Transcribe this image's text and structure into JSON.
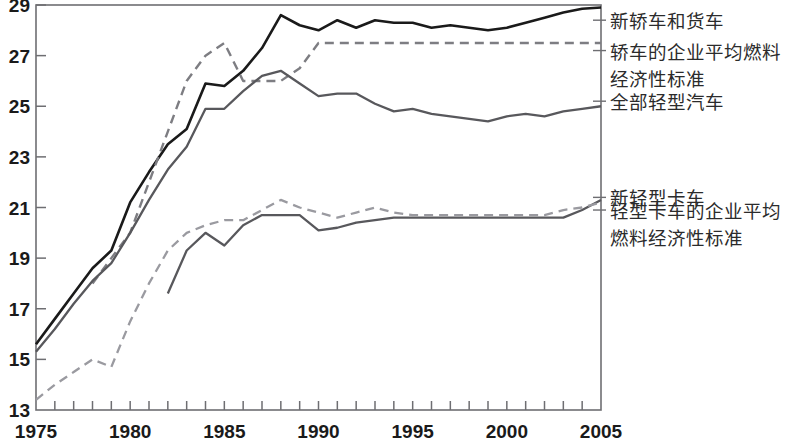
{
  "chart_data": {
    "type": "line",
    "title": "",
    "subtitle": "",
    "xlabel": "",
    "ylabel": "",
    "xlim": [
      1975,
      2005
    ],
    "ylim": [
      13,
      29
    ],
    "grid": false,
    "legend_position": "right-inline-annotations",
    "x_ticks": [
      1975,
      1980,
      1985,
      1990,
      1995,
      2000,
      2005
    ],
    "x_tick_labels": [
      "1975",
      "1980",
      "1985",
      "1990",
      "1995",
      "2000",
      "2005"
    ],
    "x_minor_tick_step": 1,
    "y_ticks": [
      13,
      15,
      17,
      19,
      21,
      23,
      25,
      27,
      29
    ],
    "y_tick_labels": [
      "13",
      "15",
      "17",
      "19",
      "21",
      "23",
      "25",
      "27",
      "29"
    ],
    "series": [
      {
        "name": "新轿车和货车",
        "style": "solid",
        "color": "#1a1a1a",
        "width": 2.6,
        "x": [
          1975,
          1976,
          1977,
          1978,
          1979,
          1980,
          1981,
          1982,
          1983,
          1984,
          1985,
          1986,
          1987,
          1988,
          1989,
          1990,
          1991,
          1992,
          1993,
          1994,
          1995,
          1996,
          1997,
          1998,
          1999,
          2000,
          2001,
          2002,
          2003,
          2004,
          2005
        ],
        "values": [
          15.6,
          16.6,
          17.6,
          18.6,
          19.3,
          21.2,
          22.4,
          23.5,
          24.1,
          25.9,
          25.8,
          26.4,
          27.3,
          28.6,
          28.2,
          28.0,
          28.4,
          28.1,
          28.4,
          28.3,
          28.3,
          28.1,
          28.2,
          28.1,
          28.0,
          28.1,
          28.3,
          28.5,
          28.7,
          28.85,
          28.9
        ]
      },
      {
        "name": "轿车的企业平均燃料经济性标准",
        "style": "dashed",
        "color": "#7d7d82",
        "width": 2.4,
        "x": [
          1978,
          1979,
          1980,
          1981,
          1982,
          1983,
          1984,
          1985,
          1986,
          1987,
          1988,
          1989,
          1990,
          1991,
          1992,
          1993,
          1994,
          1995,
          1996,
          1997,
          1998,
          1999,
          2000,
          2001,
          2002,
          2003,
          2004,
          2005
        ],
        "values": [
          18.0,
          19.0,
          20.0,
          22.0,
          24.0,
          26.0,
          27.0,
          27.5,
          26.0,
          26.0,
          26.0,
          26.5,
          27.5,
          27.5,
          27.5,
          27.5,
          27.5,
          27.5,
          27.5,
          27.5,
          27.5,
          27.5,
          27.5,
          27.5,
          27.5,
          27.5,
          27.5,
          27.5
        ]
      },
      {
        "name": "全部轻型汽车",
        "style": "solid",
        "color": "#58585c",
        "width": 2.3,
        "x": [
          1975,
          1976,
          1977,
          1978,
          1979,
          1980,
          1981,
          1982,
          1983,
          1984,
          1985,
          1986,
          1987,
          1988,
          1989,
          1990,
          1991,
          1992,
          1993,
          1994,
          1995,
          1996,
          1997,
          1998,
          1999,
          2000,
          2001,
          2002,
          2003,
          2004,
          2005
        ],
        "values": [
          15.3,
          16.2,
          17.2,
          18.1,
          18.8,
          20.0,
          21.3,
          22.5,
          23.4,
          24.9,
          24.9,
          25.6,
          26.2,
          26.4,
          25.9,
          25.4,
          25.5,
          25.5,
          25.1,
          24.8,
          24.9,
          24.7,
          24.6,
          24.5,
          24.4,
          24.6,
          24.7,
          24.6,
          24.8,
          24.9,
          25.0
        ]
      },
      {
        "name": "新轻型卡车",
        "style": "solid",
        "color": "#58585c",
        "width": 2.3,
        "x": [
          1982,
          1983,
          1984,
          1985,
          1986,
          1987,
          1988,
          1989,
          1990,
          1991,
          1992,
          1993,
          1994,
          1995,
          1996,
          1997,
          1998,
          1999,
          2000,
          2001,
          2002,
          2003,
          2004,
          2005
        ],
        "values": [
          17.6,
          19.3,
          20.0,
          19.5,
          20.3,
          20.7,
          20.7,
          20.7,
          20.1,
          20.2,
          20.4,
          20.5,
          20.6,
          20.6,
          20.6,
          20.6,
          20.6,
          20.6,
          20.6,
          20.6,
          20.6,
          20.6,
          20.9,
          21.3
        ]
      },
      {
        "name": "轻型卡车的企业平均燃料经济性标准",
        "style": "dashed",
        "color": "#9a9aa0",
        "width": 2.3,
        "x": [
          1975,
          1976,
          1977,
          1978,
          1979,
          1980,
          1981,
          1982,
          1983,
          1984,
          1985,
          1986,
          1987,
          1988,
          1989,
          1990,
          1991,
          1992,
          1993,
          1994,
          1995,
          1996,
          1997,
          1998,
          1999,
          2000,
          2001,
          2002,
          2003,
          2004,
          2005
        ],
        "values": [
          13.4,
          14.0,
          14.5,
          15.0,
          14.7,
          16.5,
          18.0,
          19.3,
          20.0,
          20.3,
          20.5,
          20.5,
          20.9,
          21.3,
          21.0,
          20.8,
          20.6,
          20.8,
          21.0,
          20.8,
          20.7,
          20.7,
          20.7,
          20.7,
          20.7,
          20.7,
          20.7,
          20.7,
          20.9,
          21.0,
          21.2
        ]
      }
    ],
    "annotations": [
      {
        "id": "annot-new-cars-trucks",
        "lines": [
          "新轿车和货车"
        ],
        "anchor_value": 28.4,
        "leader_x": 2005
      },
      {
        "id": "annot-car-cafe",
        "lines": [
          "轿车的企业平均燃料",
          "经济性标准"
        ],
        "anchor_value": 27.2,
        "leader_x": 2005
      },
      {
        "id": "annot-all-light-vehicles",
        "lines": [
          "全部轻型汽车"
        ],
        "anchor_value": 25.2,
        "leader_x": 2005
      },
      {
        "id": "annot-new-light-trucks",
        "lines": [
          "新轻型卡车"
        ],
        "anchor_value": 21.4,
        "leader_x": 2005
      },
      {
        "id": "annot-light-truck-cafe",
        "lines": [
          "轻型卡车的企业平均",
          "燃料经济性标准"
        ],
        "anchor_value": 20.9,
        "leader_x": 2005
      }
    ]
  },
  "labels": {
    "new_cars_trucks": "新轿车和货车",
    "car_cafe_l1": "轿车的企业平均燃料",
    "car_cafe_l2": "经济性标准",
    "all_light_vehicles": "全部轻型汽车",
    "new_light_trucks": "新轻型卡车",
    "light_truck_cafe_l1": "轻型卡车的企业平均",
    "light_truck_cafe_l2": "燃料经济性标准"
  },
  "colors": {
    "axis": "#6e6e72",
    "text": "#1a1a1a",
    "annotation_text": "#2b2b2b",
    "series_dark": "#1a1a1a",
    "series_mid": "#58585c",
    "series_light": "#9a9aa0"
  }
}
